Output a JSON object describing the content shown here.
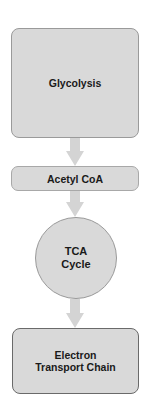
{
  "diagram": {
    "type": "flowchart",
    "direction": "top-to-bottom",
    "nodes": [
      {
        "id": "glycolysis",
        "label": "Glycolysis",
        "shape": "rounded-rectangle"
      },
      {
        "id": "acetyl_coa",
        "label": "Acetyl CoA",
        "shape": "rounded-rectangle"
      },
      {
        "id": "tca_cycle",
        "label": "TCA\nCycle",
        "shape": "circle"
      },
      {
        "id": "etc",
        "label": "Electron\nTransport Chain",
        "shape": "rounded-rectangle"
      }
    ],
    "edges": [
      {
        "from": "glycolysis",
        "to": "acetyl_coa"
      },
      {
        "from": "acetyl_coa",
        "to": "tca_cycle"
      },
      {
        "from": "tca_cycle",
        "to": "etc"
      }
    ],
    "colors": {
      "node_fill": "#d9d9d9",
      "node_border": "#9a9a9a",
      "etc_border": "#6a6a6a",
      "arrow_fill": "#d4d4d4",
      "text": "#1a1a1a",
      "background": "#ffffff"
    }
  }
}
